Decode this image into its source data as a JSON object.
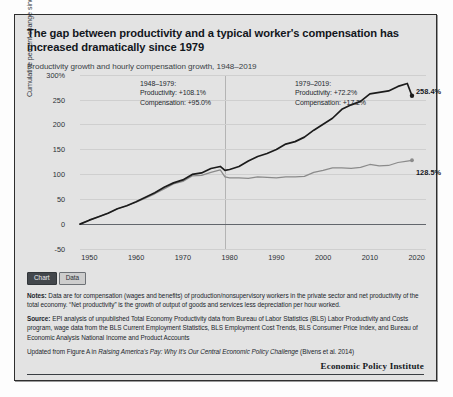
{
  "title": "The gap between productivity and a typical worker's compensation has increased dramatically since 1979",
  "subtitle": "Productivity growth and hourly compensation growth, 1948–2019",
  "toggle": {
    "chart_label": "Chart",
    "data_label": "Data"
  },
  "annotations": {
    "period1": {
      "heading": "1948–1979:",
      "productivity": "Productivity: +108.1%",
      "compensation": "Compensation: +95.0%"
    },
    "period2": {
      "heading": "1979–2019:",
      "productivity": "Productivity: +72.2%",
      "compensation": "Compensation: +17.2%"
    }
  },
  "data_labels": {
    "productivity": "258.4%",
    "compensation": "128.5%"
  },
  "footnotes": {
    "notes_label": "Notes:",
    "notes_text": " Data are for compensation (wages and benefits) of production/nonsupervisory workers in the private sector and net productivity of the total economy. “Net productivity” is the growth of output of goods and services less depreciation per hour worked.",
    "source_label": "Source:",
    "source_text": " EPI analysis of unpublished Total Economy Productivity data from Bureau of Labor Statistics (BLS) Labor Productivity and Costs program, wage data from the BLS Current Employment Statistics, BLS Employment Cost Trends, BLS Consumer Price Index, and Bureau of Economic Analysis National Income and Product Accounts",
    "updated_pre": "Updated from Figure A in ",
    "updated_italic": "Raising America's Pay: Why It's Our Central Economic Policy Challenge",
    "updated_post": " (Bivens et al. 2014)",
    "brand": "Economic Policy Institute"
  },
  "colors": {
    "productivity_line": "#1b1b1b",
    "compensation_line": "#8b8b8b",
    "panel_background": "#e3e3e3",
    "gridline": "#cfcfcf",
    "divider_1979": "#b4b4b4"
  },
  "chart_data": {
    "type": "line",
    "title": "Productivity growth and hourly compensation growth, 1948–2019",
    "xlabel": "",
    "ylabel": "Cumulative percent change since 1948",
    "xlim": [
      1948,
      2022
    ],
    "ylim": [
      -50,
      300
    ],
    "yticks": [
      "300%",
      "250",
      "200",
      "150",
      "100",
      "50",
      "0",
      "-50"
    ],
    "ytick_values": [
      300,
      250,
      200,
      150,
      100,
      50,
      0,
      -50
    ],
    "xticks": [
      1950,
      1960,
      1970,
      1980,
      1990,
      2000,
      2010,
      2020
    ],
    "grid": true,
    "legend": "none",
    "reference_line_x": 1979,
    "series": [
      {
        "name": "Productivity",
        "color": "#1b1b1b",
        "end_label": "258.4%",
        "x": [
          1948,
          1950,
          1952,
          1954,
          1956,
          1958,
          1960,
          1962,
          1964,
          1966,
          1968,
          1970,
          1972,
          1974,
          1976,
          1978,
          1979,
          1980,
          1982,
          1984,
          1986,
          1988,
          1990,
          1992,
          1994,
          1996,
          1998,
          2000,
          2002,
          2004,
          2006,
          2008,
          2010,
          2012,
          2014,
          2016,
          2018,
          2019
        ],
        "values": [
          0,
          8,
          15,
          22,
          31,
          37,
          45,
          54,
          63,
          74,
          83,
          89,
          100,
          103,
          112,
          116,
          108.1,
          110,
          116,
          127,
          136,
          142,
          150,
          161,
          166,
          175,
          189,
          201,
          213,
          231,
          240,
          247,
          262,
          265,
          268,
          277,
          283,
          258.4
        ]
      },
      {
        "name": "Compensation",
        "color": "#8b8b8b",
        "end_label": "128.5%",
        "x": [
          1948,
          1950,
          1952,
          1954,
          1956,
          1958,
          1960,
          1962,
          1964,
          1966,
          1968,
          1970,
          1972,
          1974,
          1976,
          1978,
          1979,
          1980,
          1982,
          1984,
          1986,
          1988,
          1990,
          1992,
          1994,
          1996,
          1998,
          2000,
          2002,
          2004,
          2006,
          2008,
          2010,
          2012,
          2014,
          2016,
          2018,
          2019
        ],
        "values": [
          0,
          8,
          15,
          22,
          31,
          37,
          44,
          52,
          61,
          71,
          81,
          86,
          97,
          98,
          104,
          109,
          95,
          93,
          93,
          92,
          95,
          94,
          93,
          95,
          95,
          96,
          104,
          108,
          113,
          113,
          112,
          114,
          120,
          117,
          118,
          124,
          127,
          128.5
        ]
      }
    ],
    "annotations": [
      {
        "period": "1948–1979",
        "productivity_change": 108.1,
        "compensation_change": 95.0
      },
      {
        "period": "1979–2019",
        "productivity_change": 72.2,
        "compensation_change": 17.2
      }
    ]
  }
}
